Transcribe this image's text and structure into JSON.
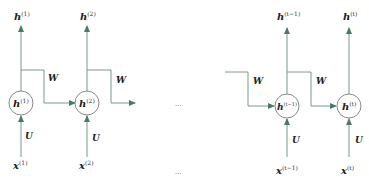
{
  "diagram": {
    "type": "rnn-unrolled",
    "colors": {
      "line": "#7a9a8a",
      "arrow": "#4a7a66",
      "circle": "#888888",
      "text": "#222222"
    },
    "cells": [
      {
        "id": "cell-1",
        "hidden": "h",
        "hidden_sup": "(1)",
        "output": "h",
        "output_sup": "(1)",
        "input": "x",
        "input_sup": "(1)",
        "input_weight": "U",
        "recurrent_weight": "W"
      },
      {
        "id": "cell-2",
        "hidden": "h",
        "hidden_sup": "(2)",
        "output": "h",
        "output_sup": "(2)",
        "input": "x",
        "input_sup": "(2)",
        "input_weight": "U",
        "recurrent_weight": "W"
      },
      {
        "id": "cell-t-1",
        "hidden": "h",
        "hidden_sup": "(t−1)",
        "output": "h",
        "output_sup": "(t−1)",
        "input": "x",
        "input_sup": "(t−1)",
        "input_weight": "U",
        "incoming_weight": "W",
        "recurrent_weight": "W"
      },
      {
        "id": "cell-t",
        "hidden": "h",
        "hidden_sup": "(t)",
        "output": "h",
        "output_sup": "(t)",
        "input": "x",
        "input_sup": "(t)",
        "input_weight": "U"
      }
    ],
    "ellipsis_middle": "···",
    "ellipsis_bottom": "···"
  }
}
